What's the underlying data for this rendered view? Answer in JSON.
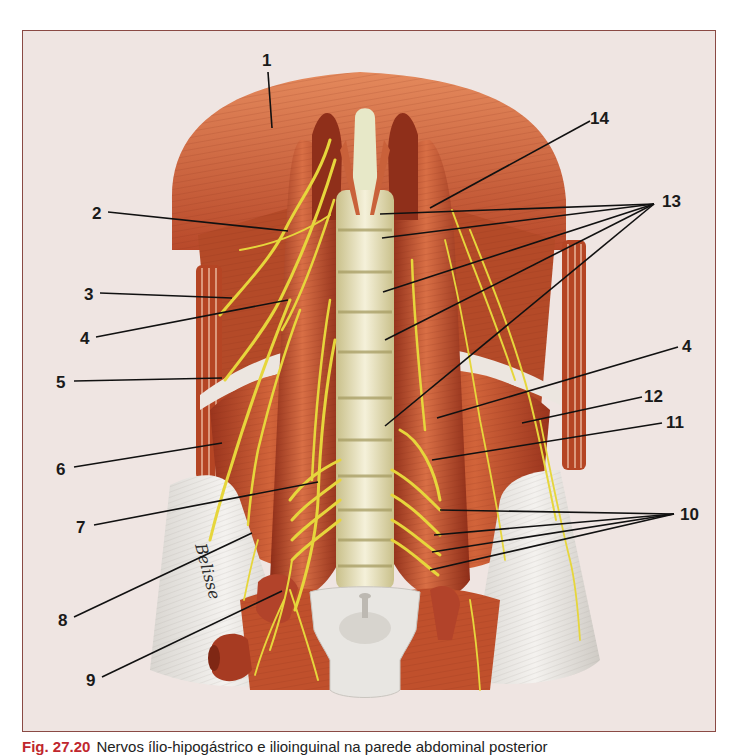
{
  "figure": {
    "frame_border_color": "#8a4a44",
    "frame_background": "#efe5e2",
    "colors": {
      "muscle": "#c2532e",
      "muscle_dark": "#8f2f1a",
      "muscle_light": "#de7a4f",
      "nerve": "#e6d63c",
      "vertebra": "#efe9c8",
      "tendon": "#e4e2de",
      "leader": "#111111"
    },
    "signature": "Belisse",
    "labels": [
      {
        "id": "1",
        "text": "1",
        "x": 262,
        "y": 52,
        "lines": [
          [
            268,
            72,
            272,
            128
          ]
        ]
      },
      {
        "id": "2",
        "text": "2",
        "x": 92,
        "y": 205,
        "lines": [
          [
            108,
            212,
            288,
            231
          ]
        ]
      },
      {
        "id": "3",
        "text": "3",
        "x": 84,
        "y": 286,
        "lines": [
          [
            100,
            293,
            232,
            298
          ]
        ]
      },
      {
        "id": "4a",
        "text": "4",
        "x": 80,
        "y": 330,
        "lines": [
          [
            96,
            337,
            288,
            300
          ]
        ]
      },
      {
        "id": "5",
        "text": "5",
        "x": 56,
        "y": 374,
        "lines": [
          [
            74,
            381,
            222,
            378
          ]
        ]
      },
      {
        "id": "6",
        "text": "6",
        "x": 56,
        "y": 461,
        "lines": [
          [
            74,
            467,
            222,
            443
          ]
        ]
      },
      {
        "id": "7",
        "text": "7",
        "x": 76,
        "y": 519,
        "lines": [
          [
            94,
            525,
            318,
            482
          ]
        ]
      },
      {
        "id": "8",
        "text": "8",
        "x": 58,
        "y": 612,
        "lines": [
          [
            74,
            617,
            252,
            533
          ]
        ]
      },
      {
        "id": "9",
        "text": "9",
        "x": 86,
        "y": 672,
        "lines": [
          [
            102,
            677,
            282,
            591
          ]
        ]
      },
      {
        "id": "14",
        "text": "14",
        "x": 590,
        "y": 110,
        "lines": [
          [
            590,
            121,
            430,
            208
          ]
        ]
      },
      {
        "id": "13",
        "text": "13",
        "x": 662,
        "y": 193,
        "lines": [
          [
            654,
            204,
            380,
            214
          ],
          [
            654,
            204,
            382,
            238
          ],
          [
            654,
            204,
            383,
            292
          ],
          [
            654,
            204,
            385,
            340
          ],
          [
            654,
            204,
            385,
            426
          ]
        ]
      },
      {
        "id": "4b",
        "text": "4",
        "x": 682,
        "y": 338,
        "lines": [
          [
            678,
            347,
            437,
            418
          ]
        ]
      },
      {
        "id": "12",
        "text": "12",
        "x": 644,
        "y": 388,
        "lines": [
          [
            642,
            397,
            522,
            423
          ]
        ]
      },
      {
        "id": "11",
        "text": "11",
        "x": 666,
        "y": 414,
        "lines": [
          [
            662,
            423,
            432,
            460
          ]
        ]
      },
      {
        "id": "10",
        "text": "10",
        "x": 680,
        "y": 506,
        "lines": [
          [
            674,
            514,
            440,
            510
          ],
          [
            674,
            514,
            434,
            535
          ],
          [
            674,
            514,
            432,
            552
          ],
          [
            674,
            514,
            430,
            570
          ]
        ]
      }
    ]
  },
  "caption": {
    "fig_number": "Fig. 27.20",
    "text": "Nervos ílio-hipogástrico e ilioinguinal na parede abdominal posterior"
  }
}
